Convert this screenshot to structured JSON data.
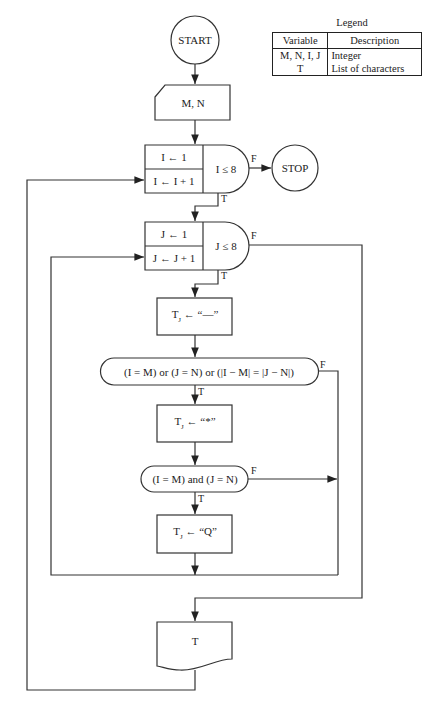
{
  "legend": {
    "title": "Legend",
    "headers": [
      "Variable",
      "Description"
    ],
    "rows": [
      {
        "variable": "M, N, I, J",
        "description": "Integer"
      },
      {
        "variable": "T",
        "description": "List of characters"
      }
    ]
  },
  "flowchart": {
    "start": "START",
    "input": "M, N",
    "outer_loop": {
      "init": "I ← 1",
      "step": "I ← I + 1",
      "condition": "I ≤ 8",
      "false_label": "F",
      "true_label": "T"
    },
    "stop": "STOP",
    "inner_loop": {
      "init": "J ← 1",
      "step": "J ← J + 1",
      "condition": "J ≤ 8",
      "false_label": "F",
      "true_label": "T"
    },
    "assign_dash": {
      "var": "T",
      "sub": "J",
      "expr": " ← “—”"
    },
    "decision_1": {
      "text": "(I = M) or (J = N) or (|I − M| = |J − N|)",
      "false_label": "F",
      "true_label": "T"
    },
    "assign_star": {
      "var": "T",
      "sub": "J",
      "expr": " ← “*”"
    },
    "decision_2": {
      "text": "(I = M) and (J = N)",
      "false_label": "F",
      "true_label": "T"
    },
    "assign_q": {
      "var": "T",
      "sub": "J",
      "expr": " ← “Q”"
    },
    "output": "T"
  }
}
